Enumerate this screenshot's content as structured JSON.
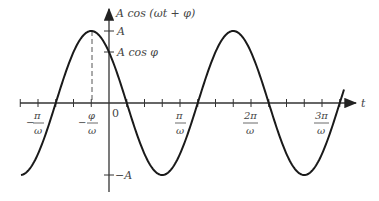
{
  "diagram": {
    "y_axis_label": "A cos (ωt + φ)",
    "x_axis_label": "t",
    "y_ticks": [
      {
        "label": "A",
        "value": 1
      },
      {
        "label": "A cos φ",
        "value": 0.7071
      },
      {
        "label": "−A",
        "value": -1
      }
    ],
    "x_ticks": [
      {
        "num": "π",
        "den": "ω",
        "sign": "−",
        "t": -1
      },
      {
        "num": "φ",
        "den": "ω",
        "sign": "−",
        "t": -0.25
      },
      {
        "num": "0",
        "den": "",
        "sign": "",
        "t": 0
      },
      {
        "num": "π",
        "den": "ω",
        "sign": "",
        "t": 1
      },
      {
        "num": "2π",
        "den": "ω",
        "sign": "",
        "t": 2
      },
      {
        "num": "3π",
        "den": "ω",
        "sign": "",
        "t": 3
      }
    ],
    "origin_label": "0",
    "phase_phi": "π/4",
    "colors": {
      "curve": "#1a1a1a",
      "axis": "#333333",
      "text": "#444444",
      "dashed": "#555555"
    }
  }
}
